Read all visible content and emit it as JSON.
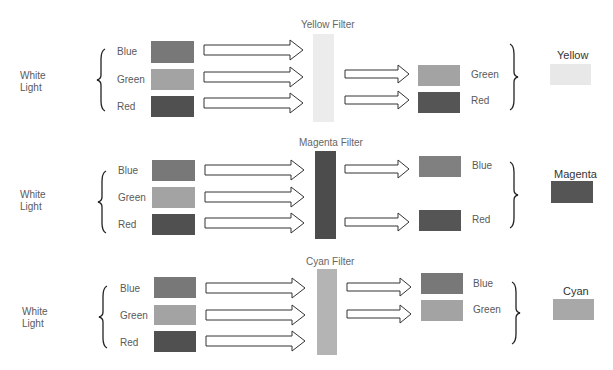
{
  "colors": {
    "blue_swatch": "#787878",
    "green_swatch": "#a3a3a3",
    "red_swatch": "#505050",
    "yellow_filter": "#ececec",
    "magenta_filter": "#4c4c4c",
    "cyan_filter": "#b4b4b4",
    "yellow_result": "#e8e8e8",
    "magenta_result": "#555555",
    "cyan_result": "#a8a8a8"
  },
  "panels": [
    {
      "source_label": [
        "White",
        "Light"
      ],
      "inputs": [
        "Blue",
        "Green",
        "Red"
      ],
      "filter_label": "Yellow Filter",
      "outputs": [
        "Green",
        "Red"
      ],
      "result_label": "Yellow"
    },
    {
      "source_label": [
        "White",
        "Light"
      ],
      "inputs": [
        "Blue",
        "Green",
        "Red"
      ],
      "filter_label": "Magenta Filter",
      "outputs": [
        "Blue",
        "Red"
      ],
      "result_label": "Magenta"
    },
    {
      "source_label": [
        "White",
        "Light"
      ],
      "inputs": [
        "Blue",
        "Green",
        "Red"
      ],
      "filter_label": "Cyan Filter",
      "outputs": [
        "Blue",
        "Green"
      ],
      "result_label": "Cyan"
    }
  ]
}
